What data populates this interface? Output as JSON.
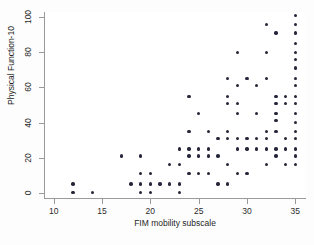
{
  "chart_data": {
    "type": "scatter",
    "title": "",
    "xlabel": "FIM mobility subscale",
    "ylabel": "Physical Function-10",
    "xlim": [
      9,
      36
    ],
    "ylim": [
      -3,
      103
    ],
    "xticks": [
      10,
      15,
      20,
      25,
      30,
      35
    ],
    "yticks": [
      0,
      20,
      40,
      60,
      80,
      100
    ],
    "xtick_labels": [
      "10",
      "15",
      "20",
      "25",
      "30",
      "35"
    ],
    "ytick_labels": [
      "0",
      "20",
      "40",
      "60",
      "80",
      "100"
    ],
    "grid": false,
    "legend": null,
    "marker": {
      "shape": "circle",
      "color": "#26263a",
      "size_px": 3.4
    },
    "points": [
      [
        12,
        5
      ],
      [
        12,
        0
      ],
      [
        14,
        0
      ],
      [
        17,
        21
      ],
      [
        18,
        5
      ],
      [
        19,
        21
      ],
      [
        19,
        11
      ],
      [
        19,
        5
      ],
      [
        19,
        0
      ],
      [
        20,
        11
      ],
      [
        20,
        5
      ],
      [
        20,
        0
      ],
      [
        21,
        5
      ],
      [
        22,
        16
      ],
      [
        22,
        5
      ],
      [
        23,
        25
      ],
      [
        23,
        16
      ],
      [
        23,
        5
      ],
      [
        23,
        0
      ],
      [
        24,
        55
      ],
      [
        24,
        35
      ],
      [
        24,
        25
      ],
      [
        24,
        21
      ],
      [
        24,
        11
      ],
      [
        25,
        45
      ],
      [
        25,
        25
      ],
      [
        25,
        21
      ],
      [
        25,
        11
      ],
      [
        26,
        35
      ],
      [
        26,
        25
      ],
      [
        26,
        21
      ],
      [
        26,
        11
      ],
      [
        27,
        31
      ],
      [
        27,
        21
      ],
      [
        27,
        5
      ],
      [
        28,
        65
      ],
      [
        28,
        55
      ],
      [
        28,
        51
      ],
      [
        28,
        35
      ],
      [
        28,
        31
      ],
      [
        28,
        16
      ],
      [
        28,
        5
      ],
      [
        29,
        80
      ],
      [
        29,
        61
      ],
      [
        29,
        51
      ],
      [
        29,
        45
      ],
      [
        29,
        31
      ],
      [
        29,
        25
      ],
      [
        29,
        11
      ],
      [
        30,
        65
      ],
      [
        30,
        31
      ],
      [
        30,
        25
      ],
      [
        30,
        11
      ],
      [
        31,
        61
      ],
      [
        31,
        45
      ],
      [
        31,
        31
      ],
      [
        31,
        25
      ],
      [
        32,
        96
      ],
      [
        32,
        80
      ],
      [
        32,
        65
      ],
      [
        32,
        35
      ],
      [
        32,
        31
      ],
      [
        32,
        25
      ],
      [
        32,
        16
      ],
      [
        33,
        91
      ],
      [
        33,
        55
      ],
      [
        33,
        51
      ],
      [
        33,
        45
      ],
      [
        33,
        41
      ],
      [
        33,
        35
      ],
      [
        33,
        25
      ],
      [
        33,
        21
      ],
      [
        34,
        55
      ],
      [
        34,
        51
      ],
      [
        34,
        31
      ],
      [
        34,
        25
      ],
      [
        34,
        16
      ],
      [
        35,
        101
      ],
      [
        35,
        96
      ],
      [
        35,
        91
      ],
      [
        35,
        85
      ],
      [
        35,
        80
      ],
      [
        35,
        76
      ],
      [
        35,
        71
      ],
      [
        35,
        65
      ],
      [
        35,
        61
      ],
      [
        35,
        55
      ],
      [
        35,
        51
      ],
      [
        35,
        45
      ],
      [
        35,
        40
      ],
      [
        35,
        35
      ],
      [
        35,
        31
      ],
      [
        35,
        25
      ],
      [
        35,
        21
      ],
      [
        35,
        16
      ]
    ]
  },
  "figure": {
    "background": "#fdfdfd",
    "plot_background": "#ffffff",
    "axis_color": "#9a9a9a",
    "text_color": "#1f1f1f"
  }
}
